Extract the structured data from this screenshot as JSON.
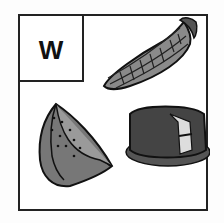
{
  "card": {
    "letter": "W",
    "images": [
      {
        "name": "corn",
        "position": "top-right"
      },
      {
        "name": "watermelon",
        "position": "bottom-left"
      },
      {
        "name": "cake",
        "position": "bottom-right"
      }
    ]
  }
}
